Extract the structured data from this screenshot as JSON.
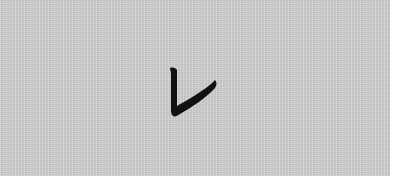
{
  "card": {
    "character": "レ",
    "character_romaji": "re",
    "script": "katakana",
    "colors": {
      "background": "#cdcdcd",
      "ink": "#111111",
      "page": "#ffffff"
    }
  }
}
